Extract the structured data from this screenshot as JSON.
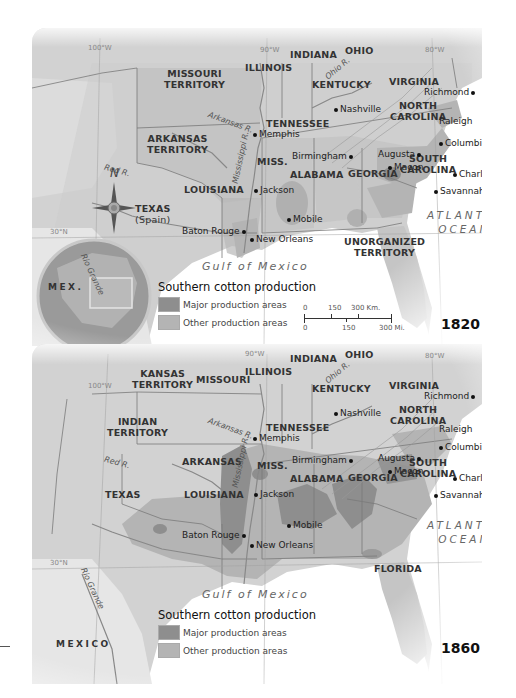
{
  "colors": {
    "land": "#cfcfcf",
    "land_light": "#e2e2e2",
    "water": "#ffffff",
    "major_production": "#8e8e8e",
    "other_production": "#b4b4b4",
    "border": "#777777"
  },
  "maps": [
    {
      "year": "1820",
      "meridians": [
        "100°W",
        "90°W",
        "80°W",
        "30°N"
      ],
      "states": [
        {
          "name": "MISSOURI\nTERRITORY",
          "l1": "MISSOURI",
          "l2": "TERRITORY"
        },
        {
          "name": "ARKANSAS TERRITORY",
          "l1": "ARKANSAS",
          "l2": "TERRITORY"
        },
        {
          "name": "ILLINOIS",
          "l1": "ILLINOIS"
        },
        {
          "name": "INDIANA",
          "l1": "INDIANA"
        },
        {
          "name": "OHIO",
          "l1": "OHIO"
        },
        {
          "name": "KENTUCKY",
          "l1": "KENTUCKY"
        },
        {
          "name": "VIRGINIA",
          "l1": "VIRGINIA"
        },
        {
          "name": "TENNESSEE",
          "l1": "TENNESSEE"
        },
        {
          "name": "NORTH CAROLINA",
          "l1": "NORTH",
          "l2": "CAROLINA"
        },
        {
          "name": "SOUTH CAROLINA",
          "l1": "SOUTH",
          "l2": "CAROLINA"
        },
        {
          "name": "MISS.",
          "l1": "MISS."
        },
        {
          "name": "ALABAMA",
          "l1": "ALABAMA"
        },
        {
          "name": "GEORGIA",
          "l1": "GEORGIA"
        },
        {
          "name": "LOUISIANA",
          "l1": "LOUISIANA"
        },
        {
          "name": "TEXAS (Spain)",
          "l1": "TEXAS",
          "l2": "(Spain)"
        },
        {
          "name": "UNORGANIZED TERRITORY",
          "l1": "UNORGANIZED",
          "l2": "TERRITORY"
        }
      ],
      "cities": [
        "Richmond",
        "Raleigh",
        "Nashville",
        "Memphis",
        "Columbia",
        "Augusta",
        "Macon",
        "Charleston",
        "Savannah",
        "Birmingham",
        "Jackson",
        "Mobile",
        "Baton Rouge",
        "New Orleans"
      ],
      "rivers": [
        "Arkansas R.",
        "Red R.",
        "Mississippi R.",
        "Ohio R.",
        "Rio Grande"
      ],
      "water": {
        "ocean_l1": "ATLANTIC",
        "ocean_l2": "OCEAN",
        "gulf": "Gulf of Mexico"
      },
      "country": "MEX.",
      "compass": "N",
      "legend": {
        "title": "Southern cotton production",
        "items": [
          {
            "label": "Major production areas",
            "color": "#8e8e8e"
          },
          {
            "label": "Other production areas",
            "color": "#b4b4b4"
          }
        ]
      },
      "scale": {
        "km_labels": [
          "0",
          "150",
          "300 Km."
        ],
        "mi_labels": [
          "0",
          "150",
          "300 Mi."
        ]
      }
    },
    {
      "year": "1860",
      "meridians": [
        "100°W",
        "90°W",
        "80°W",
        "30°N"
      ],
      "states": [
        {
          "name": "KANSAS TERRITORY",
          "l1": "KANSAS",
          "l2": "TERRITORY"
        },
        {
          "name": "MISSOURI",
          "l1": "MISSOURI"
        },
        {
          "name": "ILLINOIS",
          "l1": "ILLINOIS"
        },
        {
          "name": "INDIANA",
          "l1": "INDIANA"
        },
        {
          "name": "OHIO",
          "l1": "OHIO"
        },
        {
          "name": "KENTUCKY",
          "l1": "KENTUCKY"
        },
        {
          "name": "VIRGINIA",
          "l1": "VIRGINIA"
        },
        {
          "name": "INDIAN TERRITORY",
          "l1": "INDIAN",
          "l2": "TERRITORY"
        },
        {
          "name": "TENNESSEE",
          "l1": "TENNESSEE"
        },
        {
          "name": "NORTH CAROLINA",
          "l1": "NORTH",
          "l2": "CAROLINA"
        },
        {
          "name": "ARKANSAS",
          "l1": "ARKANSAS"
        },
        {
          "name": "MISS.",
          "l1": "MISS."
        },
        {
          "name": "ALABAMA",
          "l1": "ALABAMA"
        },
        {
          "name": "GEORGIA",
          "l1": "GEORGIA"
        },
        {
          "name": "SOUTH CAROLINA",
          "l1": "SOUTH",
          "l2": "CAROLINA"
        },
        {
          "name": "LOUISIANA",
          "l1": "LOUISIANA"
        },
        {
          "name": "TEXAS",
          "l1": "TEXAS"
        },
        {
          "name": "FLORIDA",
          "l1": "FLORIDA"
        }
      ],
      "cities": [
        "Richmond",
        "Raleigh",
        "Nashville",
        "Memphis",
        "Columbia",
        "Augusta",
        "Macon",
        "Charleston",
        "Savannah",
        "Birmingham",
        "Jackson",
        "Mobile",
        "Baton Rouge",
        "New Orleans"
      ],
      "rivers": [
        "Arkansas R.",
        "Red R.",
        "Mississippi R.",
        "Ohio R.",
        "Rio Grande"
      ],
      "water": {
        "ocean_l1": "ATLANTIC",
        "ocean_l2": "OCEAN",
        "gulf": "Gulf of Mexico"
      },
      "country": "MEXICO",
      "legend": {
        "title": "Southern cotton production",
        "items": [
          {
            "label": "Major production areas",
            "color": "#8e8e8e"
          },
          {
            "label": "Other production areas",
            "color": "#b4b4b4"
          }
        ]
      }
    }
  ]
}
